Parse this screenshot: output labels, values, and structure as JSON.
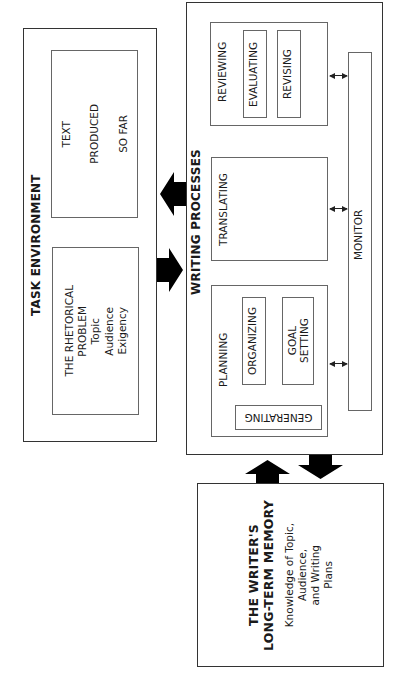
{
  "diagram": {
    "task_environment": {
      "title": "TASK ENVIRONMENT",
      "rhetorical_problem": {
        "lines": [
          "THE RHETORICAL",
          "PROBLEM",
          "Topic",
          "Audience",
          "Exigency"
        ]
      },
      "text_produced": {
        "lines": [
          "TEXT",
          "PRODUCED",
          "SO FAR"
        ]
      }
    },
    "writing_processes": {
      "title": "WRITING PROCESSES",
      "planning": {
        "label": "PLANNING",
        "generating": "GENERATING",
        "organizing": "ORGANIZING",
        "goal_setting": [
          "GOAL",
          "SETTING"
        ]
      },
      "translating": {
        "label": "TRANSLATING"
      },
      "reviewing": {
        "label": "REVIEWING",
        "evaluating": "EVALUATING",
        "revising": "REVISING"
      },
      "monitor": {
        "label": "MONITOR"
      }
    },
    "long_term_memory": {
      "title_lines": [
        "THE WRITER'S",
        "LONG-TERM MEMORY"
      ],
      "body_lines": [
        "Knowledge of Topic,",
        "Audience,",
        "and Writing",
        "Plans"
      ]
    },
    "colors": {
      "line": "#333333",
      "arrow": "#000000",
      "background": "#ffffff"
    }
  }
}
